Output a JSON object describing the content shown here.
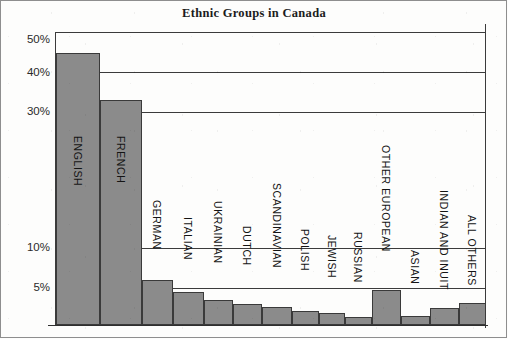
{
  "figure": {
    "title": "Ethnic Groups in Canada",
    "bar_fill_color": "#8b8b8b",
    "bar_stroke_color": "#3a3a3a",
    "axis_color": "#3b3b3b",
    "background_color": "#fdfdfc"
  },
  "axis": {
    "y_tick_labels": [
      "50%",
      "40%",
      "30%",
      "10%",
      "5%"
    ],
    "y_ticks": [
      50,
      40,
      30,
      10,
      5
    ]
  },
  "chart_data": {
    "type": "bar",
    "title": "Ethnic Groups in Canada",
    "xlabel": "",
    "ylabel": "",
    "ylim": [
      0,
      50
    ],
    "grid": true,
    "legend": null,
    "note_axis_nonlinear": "vertical scale is broken/compressed between 30% and 10%",
    "categories": [
      "ENGLISH",
      "FRENCH",
      "GERMAN",
      "ITALIAN",
      "UKRAINIAN",
      "DUTCH",
      "SCANDINAVIAN",
      "POLISH",
      "JEWISH",
      "RUSSIAN",
      "OTHER EUROPEAN",
      "ASIAN",
      "INDIAN AND INUIT",
      "ALL OTHERS"
    ],
    "values": [
      45,
      33,
      9,
      6.5,
      4.8,
      4,
      3.5,
      2.7,
      2.2,
      1.3,
      4.4,
      1.5,
      2.1,
      2.7
    ],
    "tick_labels": [
      "50%",
      "40%",
      "30%",
      "10%",
      "5%"
    ],
    "tick_values": [
      50,
      40,
      30,
      10,
      5
    ]
  },
  "bars": [
    {
      "label": "ENGLISH",
      "value": 45,
      "x": 56,
      "w": 44,
      "top": 53,
      "label_top": 136
    },
    {
      "label": "FRENCH",
      "value": 33,
      "x": 100,
      "w": 42,
      "top": 100,
      "label_top": 136
    },
    {
      "label": "GERMAN",
      "value": 9,
      "x": 142,
      "w": 31,
      "top": 280,
      "label_top": 200
    },
    {
      "label": "ITALIAN",
      "value": 6.5,
      "x": 173,
      "w": 31,
      "top": 292,
      "label_top": 217
    },
    {
      "label": "UKRAINIAN",
      "value": 4.8,
      "x": 204,
      "w": 29,
      "top": 300,
      "label_top": 201
    },
    {
      "label": "DUTCH",
      "value": 4,
      "x": 233,
      "w": 29,
      "top": 304,
      "label_top": 226
    },
    {
      "label": "SCANDINAVIAN",
      "value": 3.5,
      "x": 262,
      "w": 30,
      "top": 307,
      "label_top": 183
    },
    {
      "label": "POLISH",
      "value": 2.7,
      "x": 292,
      "w": 27,
      "top": 311,
      "label_top": 229
    },
    {
      "label": "JEWISH",
      "value": 2.2,
      "x": 319,
      "w": 26,
      "top": 313,
      "label_top": 235
    },
    {
      "label": "RUSSIAN",
      "value": 1.3,
      "x": 345,
      "w": 27,
      "top": 317,
      "label_top": 232
    },
    {
      "label": "OTHER EUROPEAN",
      "value": 4.4,
      "x": 372,
      "w": 29,
      "top": 290,
      "label_top": 145
    },
    {
      "label": "ASIAN",
      "value": 1.5,
      "x": 401,
      "w": 29,
      "top": 316,
      "label_top": 250
    },
    {
      "label": "INDIAN AND INUIT",
      "value": 2.1,
      "x": 430,
      "w": 29,
      "top": 308,
      "label_top": 190
    },
    {
      "label": "ALL OTHERS",
      "value": 2.7,
      "x": 459,
      "w": 27,
      "top": 303,
      "label_top": 215
    }
  ]
}
